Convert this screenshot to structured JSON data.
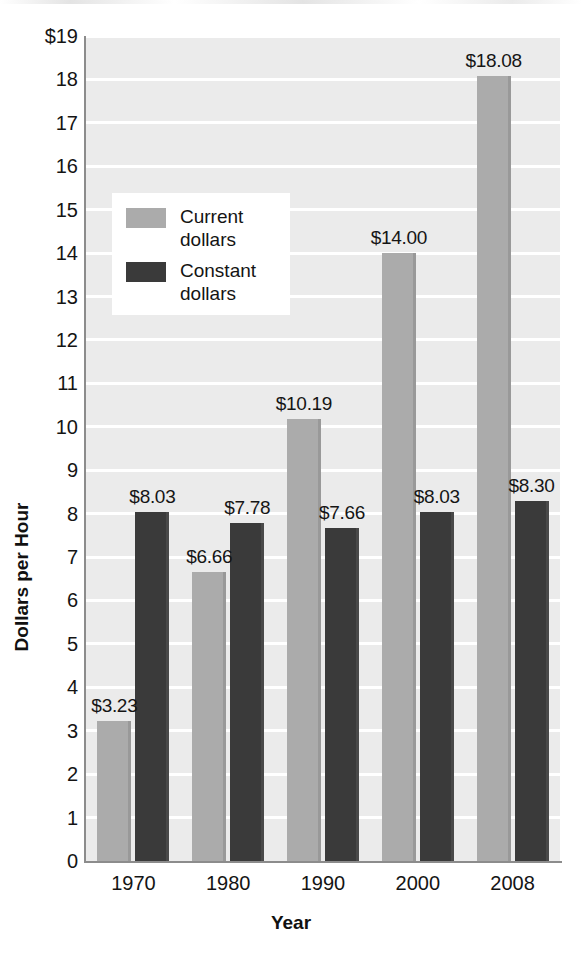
{
  "chart_data": {
    "type": "bar",
    "title": "",
    "subtitle": "",
    "xlabel": "Year",
    "ylabel": "Dollars per Hour",
    "categories": [
      "1970",
      "1980",
      "1990",
      "2000",
      "2008"
    ],
    "series": [
      {
        "name": "Current dollars",
        "color": "#ababab",
        "values": [
          3.23,
          6.66,
          10.19,
          14.0,
          18.08
        ],
        "labels": [
          "$3.23",
          "$6.66",
          "$10.19",
          "$14.00",
          "$18.08"
        ]
      },
      {
        "name": "Constant dollars",
        "color": "#3a3a3a",
        "values": [
          8.03,
          7.78,
          7.66,
          8.03,
          8.3
        ],
        "labels": [
          "$8.03",
          "$7.78",
          "$7.66",
          "$8.03",
          "$8.30"
        ]
      }
    ],
    "ylim": [
      0,
      19
    ],
    "ytick_labels": [
      "$19",
      "18",
      "17",
      "16",
      "15",
      "14",
      "13",
      "12",
      "11",
      "10",
      "9",
      "8",
      "7",
      "6",
      "5",
      "4",
      "3",
      "2",
      "1",
      "0"
    ],
    "ytick_values": [
      19,
      18,
      17,
      16,
      15,
      14,
      13,
      12,
      11,
      10,
      9,
      8,
      7,
      6,
      5,
      4,
      3,
      2,
      1,
      0
    ],
    "grid": true,
    "grid_color": "#ffffff",
    "plot_background": "#ebebeb",
    "legend_position": "upper-left-inside"
  },
  "legend": {
    "items": [
      {
        "label": "Current\ndollars",
        "color": "#ababab"
      },
      {
        "label": "Constant\ndollars",
        "color": "#3a3a3a"
      }
    ]
  }
}
